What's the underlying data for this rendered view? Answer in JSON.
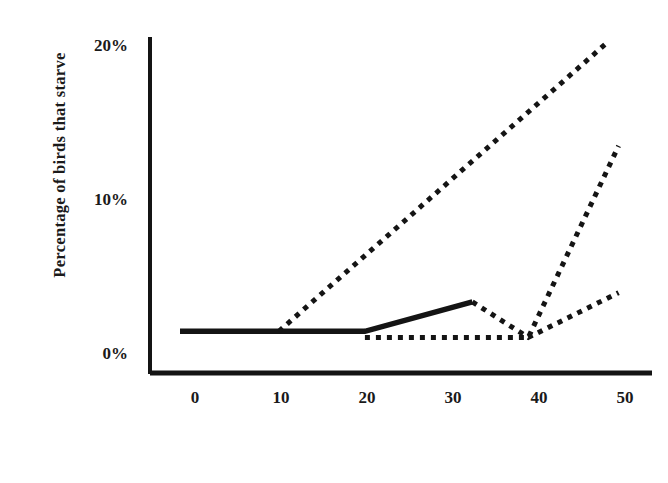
{
  "chart_data": {
    "type": "line",
    "title": "",
    "xlabel": "Density of birds on the mussel beds birds/ha",
    "ylabel": "Percentage of birds that starve",
    "xlim": [
      0,
      52
    ],
    "ylim": [
      0,
      21
    ],
    "grid": false,
    "legend": "none",
    "x_ticks": [
      "0",
      "10",
      "20",
      "30",
      "40",
      "50"
    ],
    "x_tick_values": [
      0,
      10,
      20,
      30,
      40,
      50
    ],
    "y_ticks": [
      "0%",
      "10%",
      "20%"
    ],
    "y_tick_values": [
      0,
      10,
      20
    ],
    "series": [
      {
        "name": "baseline-solid",
        "style": "solid",
        "points": [
          [
            0,
            1.6
          ],
          [
            21.5,
            1.6
          ],
          [
            34,
            3.5
          ]
        ]
      },
      {
        "name": "dotted-steep-early",
        "style": "dotted",
        "points": [
          [
            11.5,
            1.6
          ],
          [
            49.5,
            20.2
          ]
        ]
      },
      {
        "name": "dotted-steep-late",
        "style": "dotted",
        "points": [
          [
            21.5,
            1.2
          ],
          [
            40.5,
            1.2
          ],
          [
            51,
            13.6
          ]
        ]
      },
      {
        "name": "dotted-shallow",
        "style": "dotted",
        "points": [
          [
            34,
            3.5
          ],
          [
            40.5,
            1.2
          ],
          [
            51,
            4.1
          ]
        ]
      }
    ]
  },
  "axes": {
    "y_axis_line": "vertical-axis-spine",
    "x_axis_line": "horizontal-axis-spine"
  }
}
